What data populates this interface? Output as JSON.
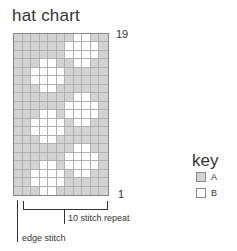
{
  "title": "hat chart",
  "row_labels": {
    "top": "19",
    "bottom": "1"
  },
  "annotations": {
    "repeat": "10 stitch repeat",
    "edge": "edge stitch"
  },
  "key": {
    "title": "key",
    "items": [
      {
        "symbol": "A",
        "label": "A",
        "color": "#d3d3d3"
      },
      {
        "symbol": "B",
        "label": "B",
        "color": "#ffffff"
      }
    ]
  },
  "chart": {
    "columns": 11,
    "rows": 19,
    "pattern_top_to_bottom": [
      "AAAAAAABBAA",
      "AAAAAABBBBA",
      "AAAAAABBBBA",
      "AAABBAABBAA",
      "AABBBBAAAAA",
      "AABBBBAAAAA",
      "AAABBAAAAAA",
      "AAAAAAABBAA",
      "AAAAAABBBBA",
      "AAABBABBBBA",
      "AABBBBABBAA",
      "AABBBBAAAAA",
      "AAABBAAAAAA",
      "AAAAAAABBAA",
      "AAAAAABBBBA",
      "AAABBABBBBA",
      "AABBBBABBAA",
      "AABBBBAAAAA",
      "AAABBAAAAAA"
    ]
  }
}
